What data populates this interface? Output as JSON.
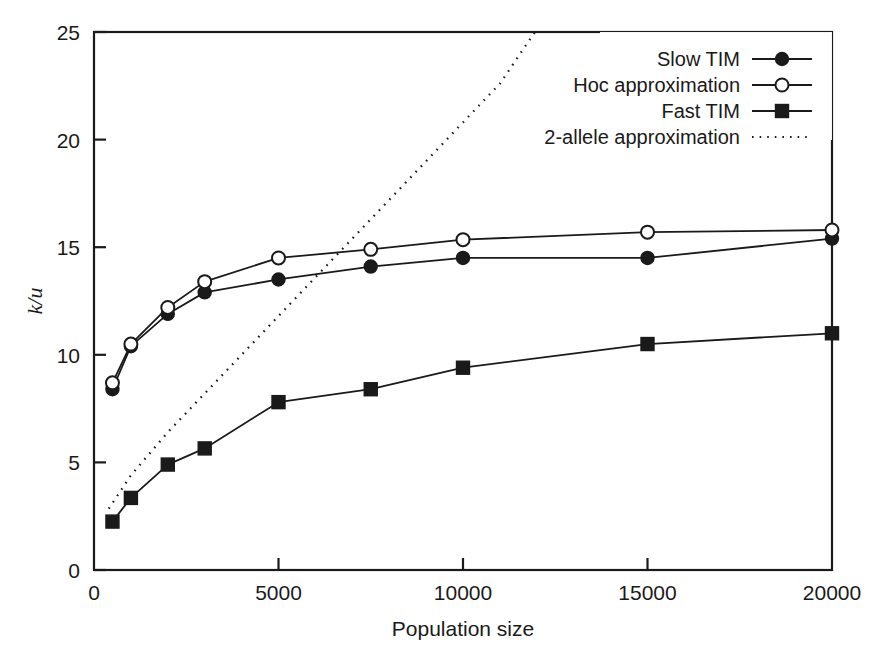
{
  "chart_data": {
    "type": "line",
    "title": "",
    "xlabel": "Population size",
    "ylabel": "k/u",
    "xlim": [
      0,
      20000
    ],
    "ylim": [
      0,
      25
    ],
    "xticks": [
      0,
      5000,
      10000,
      15000,
      20000
    ],
    "xtick_labels": [
      "0",
      "5000",
      "10000",
      "15000",
      "20000"
    ],
    "yticks": [
      0,
      5,
      10,
      15,
      20,
      25
    ],
    "ytick_labels": [
      "0",
      "5",
      "10",
      "15",
      "20",
      "25"
    ],
    "grid": false,
    "legend_position": "top-right",
    "series": [
      {
        "name": "Slow TIM",
        "marker": "filled-circle",
        "line": "solid",
        "x": [
          500,
          1000,
          2000,
          3000,
          5000,
          7500,
          10000,
          15000,
          20000
        ],
        "y": [
          8.4,
          10.4,
          11.9,
          12.9,
          13.5,
          14.1,
          14.5,
          14.5,
          15.4
        ]
      },
      {
        "name": "Hoc approximation",
        "marker": "open-circle",
        "line": "solid",
        "x": [
          500,
          1000,
          2000,
          3000,
          5000,
          7500,
          10000,
          15000,
          20000
        ],
        "y": [
          8.7,
          10.5,
          12.2,
          13.4,
          14.5,
          14.9,
          15.35,
          15.7,
          15.8
        ]
      },
      {
        "name": "Fast TIM",
        "marker": "filled-square",
        "line": "solid",
        "x": [
          500,
          1000,
          2000,
          3000,
          5000,
          7500,
          10000,
          15000,
          20000
        ],
        "y": [
          2.25,
          3.35,
          4.9,
          5.65,
          7.8,
          8.4,
          9.4,
          10.5,
          11.0
        ]
      },
      {
        "name": "2-allele approximation",
        "marker": "none",
        "line": "dotted",
        "x": [
          400,
          1000,
          2000,
          3000,
          4000,
          5000,
          6000,
          7000,
          8000,
          9000,
          10000,
          11000,
          11950
        ],
        "y": [
          2.85,
          4.4,
          6.4,
          8.2,
          10.0,
          11.8,
          13.6,
          15.4,
          17.2,
          19.0,
          20.8,
          22.6,
          25.0
        ]
      }
    ]
  },
  "legend": {
    "items": [
      {
        "label": "Slow TIM",
        "marker": "filled-circle",
        "line": "solid"
      },
      {
        "label": "Hoc approximation",
        "marker": "open-circle",
        "line": "solid"
      },
      {
        "label": "Fast TIM",
        "marker": "filled-square",
        "line": "solid"
      },
      {
        "label": "2-allele approximation",
        "marker": "none",
        "line": "dotted"
      }
    ]
  },
  "style": {
    "line_color": "#1a1a1a",
    "marker_fill": "#1a1a1a",
    "marker_open_fill": "#ffffff",
    "axis_color": "#1a1a1a",
    "background": "#ffffff"
  }
}
